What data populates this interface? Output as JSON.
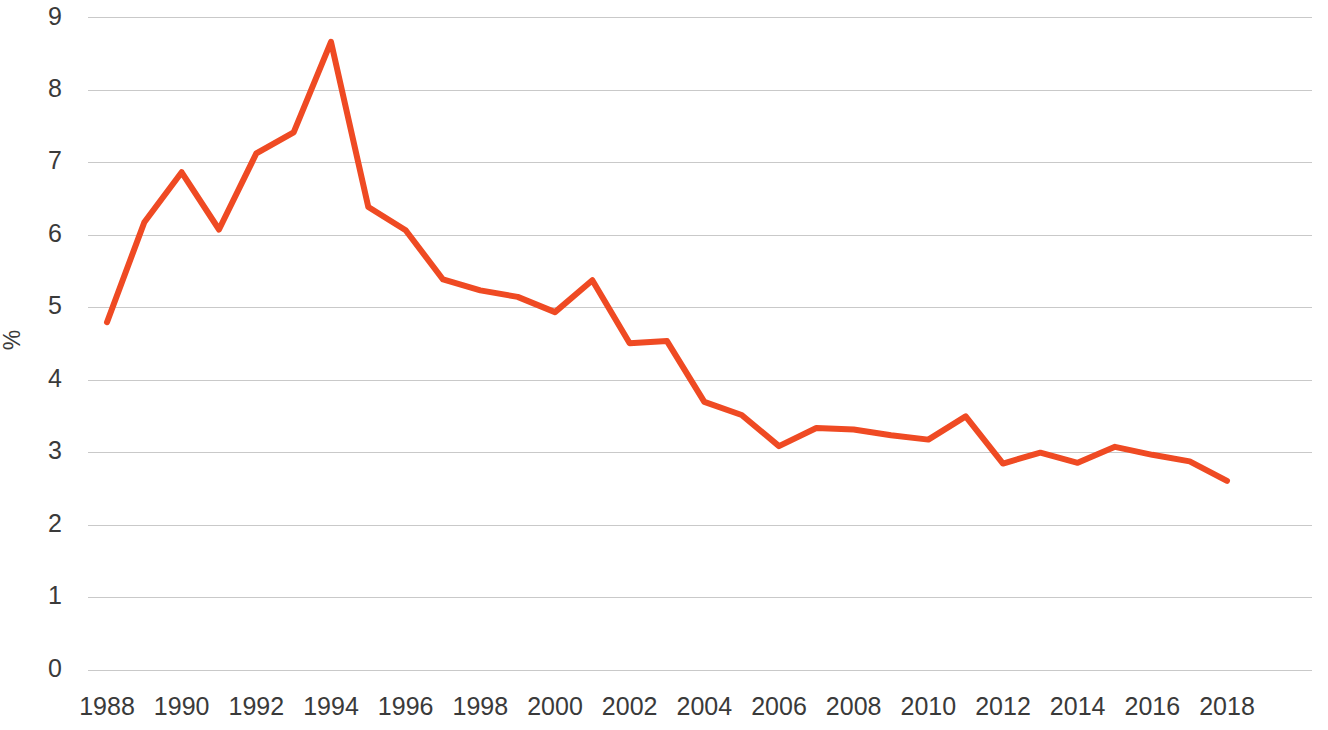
{
  "chart_data": {
    "type": "line",
    "title": "",
    "subtitle": "",
    "xlabel": "",
    "ylabel": "%",
    "x": [
      1988,
      1989,
      1990,
      1991,
      1992,
      1993,
      1994,
      1995,
      1996,
      1997,
      1998,
      1999,
      2000,
      2001,
      2002,
      2003,
      2004,
      2005,
      2006,
      2007,
      2008,
      2009,
      2010,
      2011,
      2012,
      2013,
      2014,
      2015,
      2016,
      2017,
      2018
    ],
    "series": [
      {
        "name": "",
        "color": "#ef4a23",
        "values": [
          4.8,
          6.18,
          6.87,
          6.08,
          7.13,
          7.42,
          8.67,
          6.39,
          6.07,
          5.39,
          5.24,
          5.15,
          4.94,
          5.38,
          4.51,
          4.54,
          3.7,
          3.52,
          3.09,
          3.34,
          3.32,
          3.24,
          3.18,
          3.5,
          2.85,
          3.0,
          2.86,
          3.08,
          2.97,
          2.88,
          2.61
        ]
      }
    ],
    "xlim": [
      1988,
      2018
    ],
    "ylim": [
      0,
      9
    ],
    "y_ticks": [
      0,
      1,
      2,
      3,
      4,
      5,
      6,
      7,
      8,
      9
    ],
    "y_tick_labels": [
      "0",
      "1",
      "2",
      "3",
      "4",
      "5",
      "6",
      "7",
      "8",
      "9"
    ],
    "x_ticks": [
      1988,
      1990,
      1992,
      1994,
      1996,
      1998,
      2000,
      2002,
      2004,
      2006,
      2008,
      2010,
      2012,
      2014,
      2016,
      2018
    ],
    "x_tick_labels": [
      "1988",
      "1990",
      "1992",
      "1994",
      "1996",
      "1998",
      "2000",
      "2002",
      "2004",
      "2006",
      "2008",
      "2010",
      "2012",
      "2014",
      "2016",
      "2018"
    ],
    "grid": {
      "horizontal": true,
      "vertical": false,
      "color": "#c9c9c9"
    },
    "legend": {
      "visible": false,
      "position": "none",
      "entries": []
    },
    "annotations": [],
    "line_width": 6,
    "background_color": "#ffffff",
    "axis_text_color": "#3a3a3a"
  },
  "plot_geometry": {
    "left": 88,
    "right": 1312,
    "top": 18,
    "bottom": 670,
    "x_first_tick_px": 107,
    "x_last_tick_px": 1227
  }
}
